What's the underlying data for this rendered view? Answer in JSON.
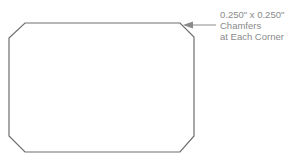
{
  "diagram": {
    "shape": "chamfered-rectangle",
    "stroke_color": "#6e6e6e",
    "callout_color": "#8a8a8a",
    "callout": {
      "line1": "0.250\" x 0.250\"",
      "line2": "Chamfers",
      "line3": "at Each Corner"
    }
  }
}
